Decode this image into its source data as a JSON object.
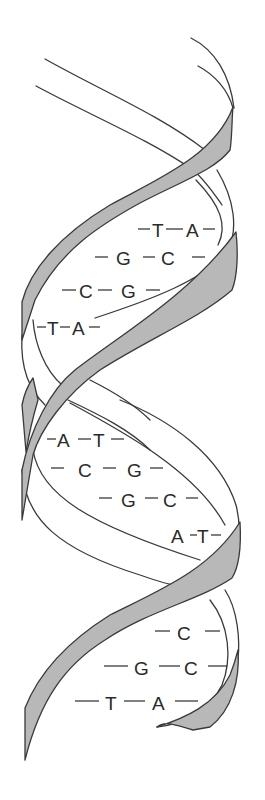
{
  "figure": {
    "colors": {
      "ribbon_fill": "#b8b8b8",
      "outline": "#3a3a3a",
      "text": "#2a2a2a",
      "background": "#ffffff"
    }
  },
  "base_pairs": [
    {
      "left": "T",
      "right": "A"
    },
    {
      "left": "G",
      "right": "C"
    },
    {
      "left": "C",
      "right": "G"
    },
    {
      "left": "T",
      "right": "A"
    },
    {
      "left": "A",
      "right": "T"
    },
    {
      "left": "C",
      "right": "G"
    },
    {
      "left": "G",
      "right": "C"
    },
    {
      "left": "A",
      "right": "T"
    },
    {
      "left": "",
      "right": "C"
    },
    {
      "left": "G",
      "right": "C"
    },
    {
      "left": "T",
      "right": "A"
    }
  ]
}
